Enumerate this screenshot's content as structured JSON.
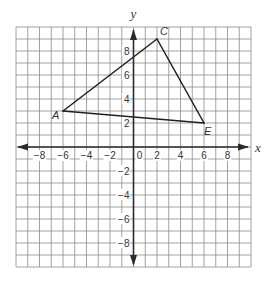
{
  "figure": {
    "axes": {
      "x_label": "x",
      "y_label": "y",
      "x_range": [
        -10,
        10
      ],
      "y_range": [
        -10,
        10
      ],
      "grid_step": 1,
      "x_tick_labels": [
        {
          "value": -8,
          "text": "−8"
        },
        {
          "value": -6,
          "text": "−6"
        },
        {
          "value": -4,
          "text": "−4"
        },
        {
          "value": -2,
          "text": "−2"
        },
        {
          "value": 0,
          "text": "0"
        },
        {
          "value": 2,
          "text": "2"
        },
        {
          "value": 4,
          "text": "4"
        },
        {
          "value": 6,
          "text": "6"
        },
        {
          "value": 8,
          "text": "8"
        }
      ],
      "y_tick_labels": [
        {
          "value": 8,
          "text": "8"
        },
        {
          "value": 6,
          "text": "6"
        },
        {
          "value": 4,
          "text": "4"
        },
        {
          "value": 2,
          "text": "2"
        },
        {
          "value": -2,
          "text": "−2"
        },
        {
          "value": -4,
          "text": "−4"
        },
        {
          "value": -6,
          "text": "−6"
        },
        {
          "value": -8,
          "text": "−8"
        }
      ]
    },
    "triangle": {
      "vertices": [
        {
          "name": "A",
          "x": -6,
          "y": 3,
          "label_offset": [
            -11,
            8
          ]
        },
        {
          "name": "C",
          "x": 2,
          "y": 9,
          "label_offset": [
            3,
            -4
          ]
        },
        {
          "name": "E",
          "x": 6,
          "y": 2,
          "label_offset": [
            0,
            12
          ]
        }
      ],
      "edges": [
        [
          "A",
          "C"
        ],
        [
          "C",
          "E"
        ],
        [
          "E",
          "A"
        ]
      ]
    },
    "colors": {
      "grid": "#8a8a8a",
      "axis": "#2b2b2b",
      "triangle": "#1f1f1f",
      "text": "#333333"
    }
  }
}
